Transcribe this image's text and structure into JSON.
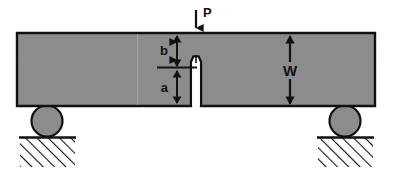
{
  "figure": {
    "background_color": "#ffffff",
    "specimen_fill": "#8c8c8c",
    "outline_color": "#111111",
    "notch_fill": "#ffffff"
  },
  "labels": {
    "load": "P",
    "ligament": "b",
    "crack_length": "a",
    "width": "W"
  },
  "annotations": {
    "load_arrow": {
      "name": "load-arrow",
      "direction": "down",
      "x": 196,
      "y_start": 10,
      "y_end": 34
    },
    "b_dimension": {
      "name": "b-dimension",
      "style": "double-headed",
      "x": 177,
      "y_top": 35,
      "y_bottom": 67,
      "label_side": "left"
    },
    "a_dimension": {
      "name": "a-dimension",
      "style": "double-headed",
      "x": 177,
      "y_top": 69,
      "y_bottom": 104,
      "label_side": "left"
    },
    "w_dimension": {
      "name": "w-dimension",
      "style": "double-headed",
      "x": 290,
      "y_top": 35,
      "y_bottom": 104,
      "label_side": "center"
    },
    "crack_tip_line": {
      "name": "crack-tip-reference-line",
      "x_start": 157,
      "x_end": 197,
      "y": 67
    }
  },
  "geometry": {
    "beam": {
      "x": 17,
      "y": 33,
      "width": 358,
      "height": 73
    },
    "notch": {
      "x_center": 196,
      "half_width": 4,
      "tip_y": 62,
      "bottom_y": 106,
      "tip_line_top_y": 55
    },
    "supports": [
      {
        "name": "left-support-roller",
        "cx": 47,
        "cy": 120,
        "r": 15
      },
      {
        "name": "right-support-roller",
        "cx": 345,
        "cy": 120,
        "r": 15
      }
    ],
    "grounds": [
      {
        "name": "left-ground-hatch",
        "x": 20,
        "y": 137,
        "width": 55,
        "height": 30
      },
      {
        "name": "right-ground-hatch",
        "x": 318,
        "y": 137,
        "width": 55,
        "height": 30
      }
    ],
    "seam_line": {
      "name": "scan-seam-line",
      "x": 137,
      "y_top": 33,
      "y_bottom": 106
    }
  }
}
